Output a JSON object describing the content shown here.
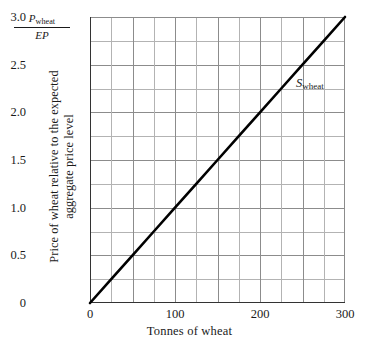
{
  "chart_data": {
    "type": "line",
    "title": "",
    "xlabel": "Tonnes of wheat",
    "ylabel_line1": "Price of wheat relative to the expected",
    "ylabel_line2": "aggregate price level",
    "ylabel_symbol_numerator": "P",
    "ylabel_symbol_numerator_sub": "wheat",
    "ylabel_symbol_denominator": "EP",
    "xlim": [
      0,
      300
    ],
    "ylim": [
      0,
      3.0
    ],
    "grid": true,
    "grid_x_step": 25,
    "grid_y_step": 0.25,
    "legend": "none",
    "xticks": [
      0,
      100,
      200,
      300
    ],
    "xtick_labels": [
      "0",
      "100",
      "200",
      "300"
    ],
    "yticks": [
      0,
      0.5,
      1.0,
      1.5,
      2.0,
      2.5,
      3.0
    ],
    "ytick_labels": [
      "0",
      "0.5",
      "1.0",
      "1.5",
      "2.0",
      "2.5",
      "3.0"
    ],
    "series": [
      {
        "name": "S_wheat",
        "label_symbol": "S",
        "label_sub": "wheat",
        "color": "#000000",
        "x": [
          0,
          25,
          50,
          75,
          100,
          125,
          150,
          175,
          200,
          225,
          250,
          275,
          300
        ],
        "y": [
          0,
          0.25,
          0.5,
          0.75,
          1.0,
          1.25,
          1.5,
          1.75,
          2.0,
          2.25,
          2.5,
          2.75,
          3.0
        ]
      }
    ],
    "annotations": [
      {
        "text": "S_wheat",
        "x": 250,
        "y": 2.45
      }
    ],
    "colors": {
      "line": "#000000",
      "grid_minor": "#b3b3b3",
      "grid_major": "#8c8c8c",
      "axis": "#333333",
      "background": "#ffffff",
      "text": "#1a1a1a"
    }
  }
}
